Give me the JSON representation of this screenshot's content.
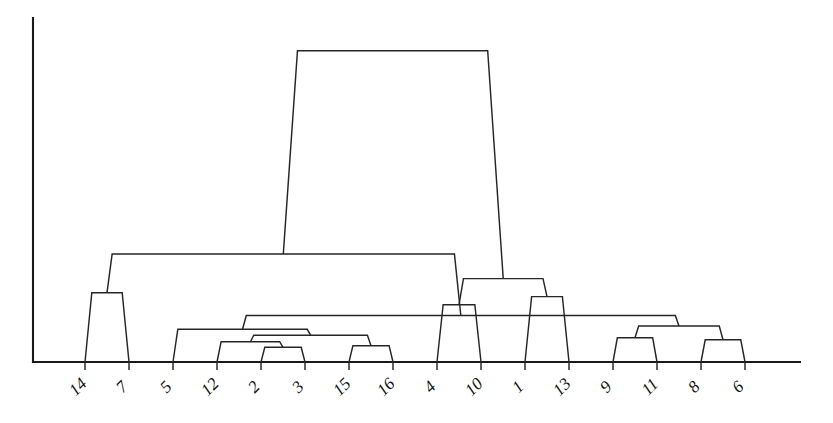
{
  "figure": {
    "type": "dendrogram",
    "title": "",
    "background_color": "#ffffff",
    "line_color": "#262626",
    "axis_color": "#1a1a1a",
    "width": 833,
    "height": 423
  },
  "axes": {
    "y_axis_visible": true,
    "x_axis_visible": true,
    "y_axis_label": "",
    "x_axis_label": "",
    "y_tick_labels": [],
    "grid": false,
    "plot_left": 33,
    "plot_right": 800,
    "plot_top": 18,
    "plot_baseline": 362
  },
  "chart_data": {
    "type": "dendrogram",
    "title": "",
    "xlabel": "",
    "ylabel": "",
    "orientation": "vertical",
    "link_style": "trapezoid",
    "leaf_labels": [
      "14",
      "7",
      "5",
      "12",
      "2",
      "3",
      "15",
      "16",
      "4",
      "10",
      "1",
      "13",
      "9",
      "11",
      "8",
      "6"
    ],
    "leaf_count": 16,
    "leaf_x_positions": [
      85,
      129,
      173,
      217,
      261,
      305,
      349,
      393,
      437,
      481,
      525,
      569,
      613,
      657,
      701,
      745
    ],
    "ylim": [
      0,
      1.0
    ],
    "y_axis_inverted": false,
    "merges": [
      {
        "id": "m1",
        "left": "2",
        "right": "3",
        "height": 0.045,
        "x": 283.0
      },
      {
        "id": "m2",
        "left": "12",
        "right": "m1",
        "height": 0.062,
        "x": 250.0
      },
      {
        "id": "m3",
        "left": "15",
        "right": "16",
        "height": 0.05,
        "x": 371.0
      },
      {
        "id": "m4",
        "left": "m2",
        "right": "m3",
        "height": 0.082,
        "x": 310.5
      },
      {
        "id": "m5",
        "left": "5",
        "right": "m4",
        "height": 0.1,
        "x": 241.7
      },
      {
        "id": "m6",
        "left": "9",
        "right": "11",
        "height": 0.074,
        "x": 635.0
      },
      {
        "id": "m7",
        "left": "8",
        "right": "6",
        "height": 0.068,
        "x": 723.0
      },
      {
        "id": "m8",
        "left": "m6",
        "right": "m7",
        "height": 0.11,
        "x": 679.0
      },
      {
        "id": "m9",
        "left": "m5",
        "right": "m8",
        "height": 0.142,
        "x": 460.3
      },
      {
        "id": "m10",
        "left": "4",
        "right": "10",
        "height": 0.175,
        "x": 459.0
      },
      {
        "id": "m11",
        "left": "1",
        "right": "13",
        "height": 0.2,
        "x": 547.0
      },
      {
        "id": "m12",
        "left": "m10",
        "right": "m11",
        "height": 0.255,
        "x": 503.0
      },
      {
        "id": "m13",
        "left": "14",
        "right": "7",
        "height": 0.212,
        "x": 107.0
      },
      {
        "id": "m14",
        "left": "m13",
        "right": "m9",
        "height": 0.33,
        "x": 283.6
      },
      {
        "id": "m15",
        "left": "m14",
        "right": "m12",
        "height": 0.952,
        "x": 393.3
      }
    ],
    "cluster_count_at_top": 5,
    "root_height": 0.952
  },
  "tick_labels": {
    "rotation_degrees": -45,
    "items": [
      {
        "label": "14",
        "x": 85
      },
      {
        "label": "7",
        "x": 129
      },
      {
        "label": "5",
        "x": 173
      },
      {
        "label": "12",
        "x": 217
      },
      {
        "label": "2",
        "x": 261
      },
      {
        "label": "3",
        "x": 305
      },
      {
        "label": "15",
        "x": 349
      },
      {
        "label": "16",
        "x": 393
      },
      {
        "label": "4",
        "x": 437
      },
      {
        "label": "10",
        "x": 481
      },
      {
        "label": "1",
        "x": 525
      },
      {
        "label": "13",
        "x": 569
      },
      {
        "label": "9",
        "x": 613
      },
      {
        "label": "11",
        "x": 657
      },
      {
        "label": "8",
        "x": 701
      },
      {
        "label": "6",
        "x": 745
      }
    ]
  }
}
